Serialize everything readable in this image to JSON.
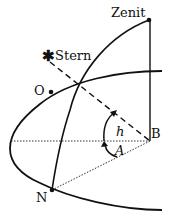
{
  "diagram": {
    "labels": {
      "zenith": "Zenit",
      "star": "Stern",
      "east": "O",
      "north": "N",
      "observer": "B",
      "altitude": "h",
      "azimuth": "A"
    },
    "star_symbol": "✱",
    "colors": {
      "stroke": "#111111",
      "background": "#ffffff"
    }
  }
}
